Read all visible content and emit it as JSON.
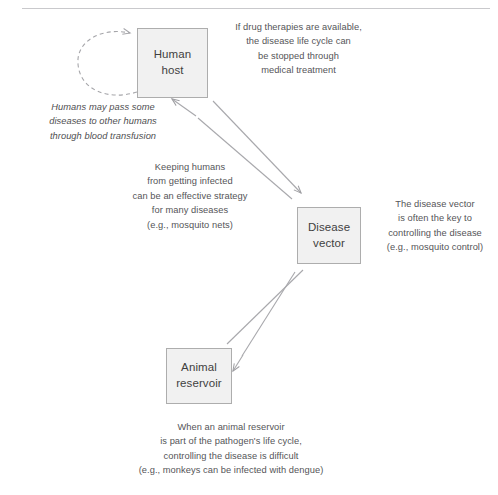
{
  "diagram": {
    "stroke_color": "#a8a8ac",
    "box_fill_color": "#f1f1f1",
    "box_border_color": "#adadad",
    "text_color": "#555558",
    "rule_color": "#c9c9cc",
    "nodes": [
      {
        "id": "human-host",
        "label": "Human\nhost"
      },
      {
        "id": "disease-vector",
        "label": "Disease\nvector"
      },
      {
        "id": "animal-reservoir",
        "label": "Animal\nreservoir"
      }
    ],
    "annotations": [
      {
        "id": "drug-therapies",
        "style": "normal",
        "text": "If drug therapies are available,\nthe disease life cycle can\nbe stopped through\nmedical treatment"
      },
      {
        "id": "blood-transfusion",
        "style": "italic",
        "text": "Humans may pass some\ndiseases to other humans\nthrough blood transfusion"
      },
      {
        "id": "mosquito-nets",
        "style": "normal",
        "text": "Keeping humans\nfrom getting infected\ncan be an effective strategy\nfor many diseases\n(e.g., mosquito nets)"
      },
      {
        "id": "disease-vector-key",
        "style": "normal",
        "text": "The disease vector\nis often the key to\ncontrolling the disease\n(e.g., mosquito control)"
      },
      {
        "id": "animal-reservoir-note",
        "style": "normal",
        "text": "When an animal reservoir\nis part of the pathogen's life cycle,\ncontrolling the disease is difficult\n(e.g., monkeys can be infected with dengue)"
      }
    ],
    "connectors": [
      {
        "id": "human-host-self-loop",
        "from": "human-host",
        "to": "human-host",
        "style": "dashed",
        "arrowheads": 1,
        "meaning": "human to human transmission"
      },
      {
        "id": "human-host-to-disease-vector",
        "from": "human-host",
        "to": "disease-vector",
        "style": "solid",
        "arrowheads": 2,
        "meaning": "bidirectional transmission between human host and disease vector"
      },
      {
        "id": "animal-reservoir-to-disease-vector",
        "from": "animal-reservoir",
        "to": "disease-vector",
        "style": "solid",
        "arrowheads": 2,
        "meaning": "bidirectional transmission between animal reservoir and disease vector"
      }
    ]
  }
}
